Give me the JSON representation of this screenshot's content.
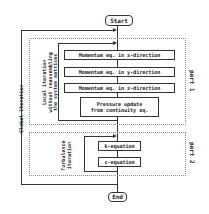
{
  "diagram": {
    "terminals": {
      "start": "Start",
      "end": "End"
    },
    "global_loop_label": "Global Iteration",
    "part1": {
      "label": "part 1",
      "loop_label_lines": [
        "Local iteration",
        "without reassembling",
        "the system matrices"
      ],
      "steps": [
        "Momentum eq. in x-direction",
        "Momentum eq. in y-direction",
        "Momentum eq. in z-direction"
      ],
      "pressure_lines": [
        "Pressure update",
        "from continuity eq."
      ]
    },
    "part2": {
      "label": "part 2",
      "loop_label_lines": [
        "Turbulence",
        "iteration"
      ],
      "steps": [
        "k-equation",
        "ε-equation"
      ]
    },
    "colors": {
      "line": "#333333",
      "dotted": "#888888",
      "background": "#ffffff"
    }
  }
}
